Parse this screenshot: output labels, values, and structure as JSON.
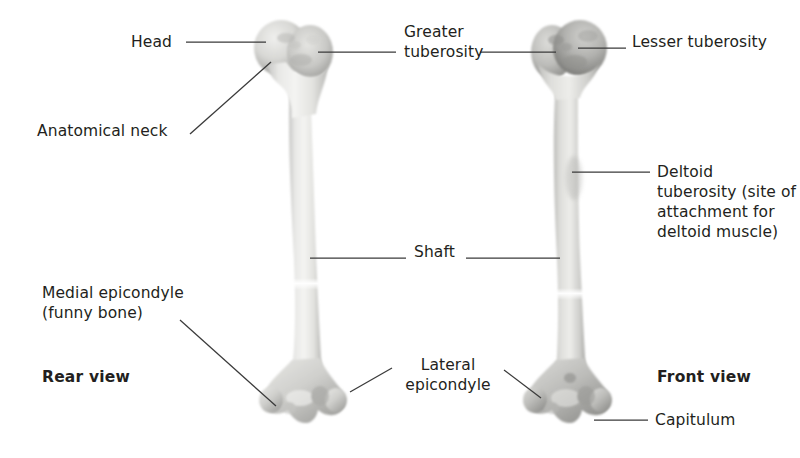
{
  "figure": {
    "background_color": "#ffffff",
    "text_color": "#231f20",
    "leader_line_color": "#3a3a3a"
  },
  "views": {
    "left": {
      "caption": "Rear view"
    },
    "right": {
      "caption": "Front view"
    }
  },
  "labels": {
    "head": "Head",
    "anatomical_neck": "Anatomical neck",
    "greater_tuberosity": "Greater\ntuberosity",
    "lesser_tuberosity": "Lesser tuberosity",
    "deltoid_tuberosity": "Deltoid\ntuberosity (site of\nattachment for\ndeltoid muscle)",
    "shaft": "Shaft",
    "medial_epicondyle": "Medial epicondyle\n(funny bone)",
    "lateral_epicondyle": "Lateral\nepicondyle",
    "capitulum": "Capitulum"
  }
}
